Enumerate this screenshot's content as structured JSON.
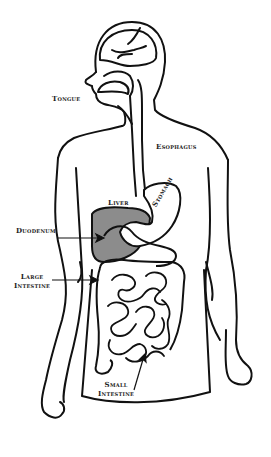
{
  "colors": {
    "outline": "#111111",
    "organ_fill": "#8c8c8c",
    "background": "#ffffff"
  },
  "labels": {
    "tongue": "Tongue",
    "esophagus": "Esophagus",
    "liver": "Liver",
    "stomach": "Stomach",
    "duodenum": "Duodenum",
    "large_intestine_line1": "Large",
    "large_intestine_line2": "Intestine",
    "small_intestine_line1": "Small",
    "small_intestine_line2": "Intestine"
  }
}
